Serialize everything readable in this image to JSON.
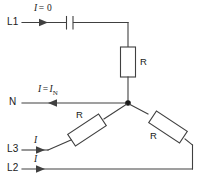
{
  "figure": {
    "type": "electrical-schematic",
    "stroke_color": "#404040",
    "text_color": "#1a1a1a",
    "background": "#ffffff"
  },
  "terminals": [
    {
      "id": "l1",
      "label": "L1"
    },
    {
      "id": "n",
      "label": "N"
    },
    {
      "id": "l3",
      "label": "L3"
    },
    {
      "id": "l2",
      "label": "L2"
    }
  ],
  "components": [
    {
      "id": "capacitor-l1",
      "symbol": "capacitor",
      "label": ""
    },
    {
      "id": "resistor-top",
      "symbol": "resistor",
      "label": "R"
    },
    {
      "id": "resistor-left",
      "symbol": "resistor",
      "label": "R"
    },
    {
      "id": "resistor-right",
      "symbol": "resistor",
      "label": "R"
    }
  ],
  "annotations": {
    "l1_current": {
      "i": "I",
      "eq": "=",
      "value": "0"
    },
    "n_current": {
      "i": "I",
      "eq": "=",
      "value": "I",
      "sub": "N"
    },
    "l3_current": {
      "i": "I"
    },
    "l2_current": {
      "i": "I"
    }
  }
}
